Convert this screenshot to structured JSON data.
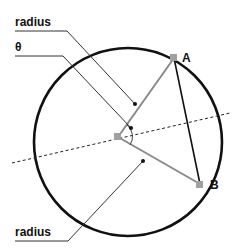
{
  "diagram": {
    "labels": {
      "radius_top": "radius",
      "theta": "θ",
      "radius_bottom": "radius",
      "point_a": "A",
      "point_b": "B"
    },
    "colors": {
      "circle": "#111111",
      "radius_lines": "#8a8a8a",
      "chord": "#111111",
      "leader_lines": "#333333",
      "points": "#a0a0a0"
    }
  }
}
